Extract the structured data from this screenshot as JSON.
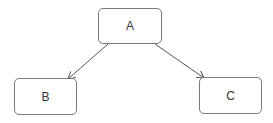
{
  "diagram": {
    "nodes": [
      {
        "id": "A",
        "label": "A",
        "x": 98,
        "y": 8,
        "w": 64,
        "h": 36
      },
      {
        "id": "B",
        "label": "B",
        "x": 14,
        "y": 78,
        "w": 63,
        "h": 37
      },
      {
        "id": "C",
        "label": "C",
        "x": 199,
        "y": 77,
        "w": 63,
        "h": 37
      }
    ],
    "edges": [
      {
        "from": "A",
        "to": "B"
      },
      {
        "from": "A",
        "to": "C"
      }
    ],
    "colors": {
      "stroke": "#7a7a7a",
      "text": "#333333",
      "background": "#ffffff"
    }
  }
}
